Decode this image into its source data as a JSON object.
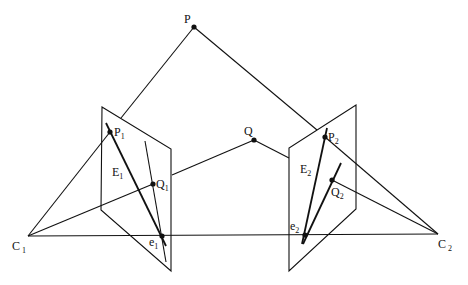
{
  "diagram": {
    "title": "",
    "colors": {
      "stroke": "#111111",
      "background": "#ffffff"
    },
    "points": {
      "P": {
        "label": "P",
        "sub": "",
        "x": 194,
        "y": 27
      },
      "Q": {
        "label": "Q",
        "sub": "",
        "x": 254,
        "y": 140
      },
      "C1": {
        "label": "C",
        "sub": "1",
        "x": 28,
        "y": 236
      },
      "C2": {
        "label": "C",
        "sub": "2",
        "x": 438,
        "y": 234
      },
      "P1": {
        "label": "P",
        "sub": "1",
        "x": 110,
        "y": 132
      },
      "Q1": {
        "label": "Q",
        "sub": "1",
        "x": 153,
        "y": 184
      },
      "e1": {
        "label": "e",
        "sub": "1",
        "x": 162,
        "y": 236
      },
      "P2": {
        "label": "P",
        "sub": "2",
        "x": 325,
        "y": 137
      },
      "Q2": {
        "label": "Q",
        "sub": "2",
        "x": 332,
        "y": 180
      },
      "e2": {
        "label": "e",
        "sub": "2",
        "x": 305,
        "y": 235
      }
    },
    "lines": {
      "E1": {
        "label": "E",
        "sub": "1"
      },
      "E2": {
        "label": "E",
        "sub": "2"
      }
    },
    "planes": [
      {
        "name": "left-image-plane",
        "corners": [
          [
            102,
            107
          ],
          [
            171,
            149
          ],
          [
            171,
            271
          ],
          [
            101,
            210
          ]
        ]
      },
      {
        "name": "right-image-plane",
        "corners": [
          [
            356,
            105
          ],
          [
            356,
            209
          ],
          [
            289,
            271
          ],
          [
            289,
            148
          ]
        ]
      }
    ]
  }
}
